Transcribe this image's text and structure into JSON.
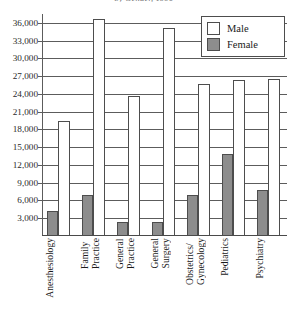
{
  "chart_data": {
    "type": "bar",
    "title": "by Gender, 1990",
    "xlabel": "",
    "ylabel": "",
    "ylim": [
      0,
      37500
    ],
    "grid": true,
    "legend_position": "top-right",
    "categories": [
      "Anesthesiology",
      "Family\nPractice",
      "General\nPractice",
      "General\nSurgery",
      "Obstetrics/\nGynecology",
      "Pediatrics",
      "Psychiatry"
    ],
    "yticks": [
      3000,
      6000,
      9000,
      12000,
      15000,
      18000,
      21000,
      24000,
      27000,
      30000,
      33000,
      36000
    ],
    "ytick_labels": [
      "3,000",
      "6,000",
      "9,000",
      "12,000",
      "15,000",
      "18,000",
      "21,000",
      "24,000",
      "27,000",
      "30,000",
      "33,000",
      "36,000"
    ],
    "series": [
      {
        "name": "Male",
        "color": "#ffffff",
        "values": [
          19500,
          36600,
          23700,
          35100,
          25700,
          26300,
          26600
        ]
      },
      {
        "name": "Female",
        "color": "#8d8d8d",
        "values": [
          4200,
          7000,
          2300,
          2300,
          6900,
          13800,
          7700
        ]
      }
    ]
  },
  "legend": {
    "items": [
      {
        "label": "Male"
      },
      {
        "label": "Female"
      }
    ]
  }
}
